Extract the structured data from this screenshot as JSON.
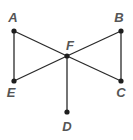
{
  "diagram": {
    "type": "graph",
    "nodes": [
      {
        "id": "A",
        "label": "A"
      },
      {
        "id": "B",
        "label": "B"
      },
      {
        "id": "C",
        "label": "C"
      },
      {
        "id": "D",
        "label": "D"
      },
      {
        "id": "E",
        "label": "E"
      },
      {
        "id": "F",
        "label": "F"
      }
    ],
    "edges": [
      [
        "A",
        "E"
      ],
      [
        "A",
        "F"
      ],
      [
        "E",
        "F"
      ],
      [
        "B",
        "F"
      ],
      [
        "B",
        "C"
      ],
      [
        "C",
        "F"
      ],
      [
        "D",
        "F"
      ]
    ]
  }
}
